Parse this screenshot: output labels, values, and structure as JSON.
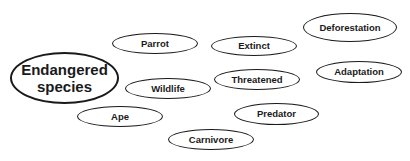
{
  "diagram": {
    "type": "word-cloud-concept-map",
    "central": {
      "line1": "Endangered",
      "line2": "species"
    },
    "nodes": [
      {
        "id": "parrot",
        "label": "Parrot"
      },
      {
        "id": "extinct",
        "label": "Extinct"
      },
      {
        "id": "deforestation",
        "label": "Deforestation"
      },
      {
        "id": "wildlife",
        "label": "Wildlife"
      },
      {
        "id": "threatened",
        "label": "Threatened"
      },
      {
        "id": "adaptation",
        "label": "Adaptation"
      },
      {
        "id": "ape",
        "label": "Ape"
      },
      {
        "id": "predator",
        "label": "Predator"
      },
      {
        "id": "carnivore",
        "label": "Carnivore"
      }
    ],
    "colors": {
      "stroke": "#1a1a1a",
      "background": "#ffffff",
      "text": "#1a1a1a"
    }
  }
}
